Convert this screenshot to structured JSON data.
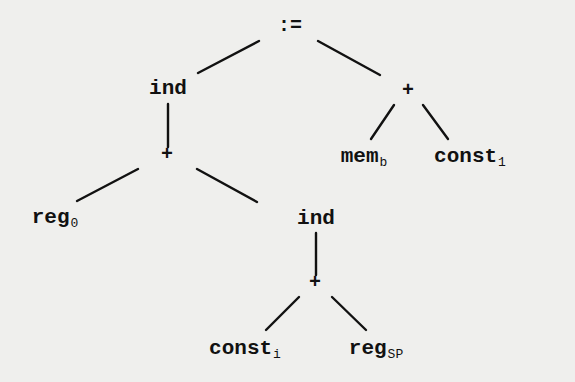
{
  "diagram": {
    "type": "expression-tree",
    "nodes": {
      "root": {
        "label": ":=",
        "sub": ""
      },
      "ind_upper": {
        "label": "ind",
        "sub": ""
      },
      "plus_right": {
        "label": "+",
        "sub": ""
      },
      "mem_b": {
        "label": "mem",
        "sub": "b"
      },
      "const_1": {
        "label": "const",
        "sub": "1"
      },
      "plus_left": {
        "label": "+",
        "sub": ""
      },
      "reg_0": {
        "label": "reg",
        "sub": "0"
      },
      "ind_lower": {
        "label": "ind",
        "sub": ""
      },
      "plus_lower": {
        "label": "+",
        "sub": ""
      },
      "const_i": {
        "label": "const",
        "sub": "i"
      },
      "reg_sp": {
        "label": "reg",
        "sub": "SP"
      }
    },
    "edges": [
      [
        "root",
        "ind_upper"
      ],
      [
        "root",
        "plus_right"
      ],
      [
        "plus_right",
        "mem_b"
      ],
      [
        "plus_right",
        "const_1"
      ],
      [
        "ind_upper",
        "plus_left"
      ],
      [
        "plus_left",
        "reg_0"
      ],
      [
        "plus_left",
        "ind_lower"
      ],
      [
        "ind_lower",
        "plus_lower"
      ],
      [
        "plus_lower",
        "const_i"
      ],
      [
        "plus_lower",
        "reg_sp"
      ]
    ]
  }
}
